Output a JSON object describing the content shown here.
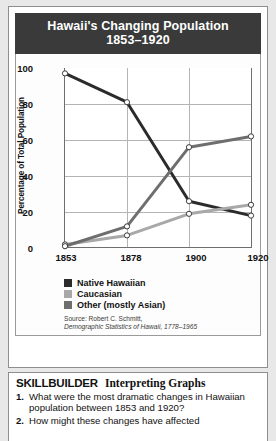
{
  "figure": {
    "title_line1": "Hawaii's Changing Population",
    "title_line2": "1853–1920",
    "source_line1": "Source: Robert C. Schmitt,",
    "source_line2": "Demographic Statistics of Hawaii, 1778–1965"
  },
  "chart_data": {
    "type": "line",
    "title": "Hawaii's Changing Population 1853–1920",
    "xlabel": "",
    "ylabel": "Percentage of Total Population",
    "categories": [
      "1853",
      "1878",
      "1900",
      "1920"
    ],
    "x": [
      1853,
      1878,
      1900,
      1920
    ],
    "xlim": [
      1853,
      1920
    ],
    "ylim": [
      0,
      100
    ],
    "yticks": [
      0,
      20,
      40,
      60,
      80,
      100
    ],
    "grid": true,
    "legend_position": "below",
    "series": [
      {
        "name": "Native Hawaiian",
        "color": "#2b2b2b",
        "values": [
          97,
          81,
          26,
          18
        ]
      },
      {
        "name": "Caucasian",
        "color": "#a8a8a8",
        "values": [
          2,
          7,
          19,
          24
        ]
      },
      {
        "name": "Other (mostly Asian)",
        "color": "#6e6e6e",
        "values": [
          1,
          12,
          56,
          62
        ]
      }
    ]
  },
  "skillbuilder": {
    "title": "SKILLBUILDER",
    "subtitle": "Interpreting Graphs",
    "questions": [
      {
        "number": "1.",
        "text": "What were the most dramatic changes in Hawaiian population between 1853 and 1920?"
      },
      {
        "number": "2.",
        "text": "How might these changes have affected"
      }
    ]
  }
}
